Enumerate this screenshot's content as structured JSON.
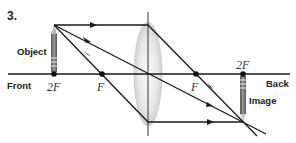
{
  "figure": {
    "number_label": "3.",
    "object_label": "Object",
    "image_label": "Image",
    "front_label": "Front",
    "back_label": "Back",
    "focal_points": {
      "front_2f": "2F",
      "front_f": "F",
      "back_f": "F",
      "back_2f": "2F"
    }
  },
  "colors": {
    "line": "#1a1a1a",
    "lens_fill": "#e6e6e6",
    "object_body": "#777777",
    "background": "#ffffff"
  }
}
